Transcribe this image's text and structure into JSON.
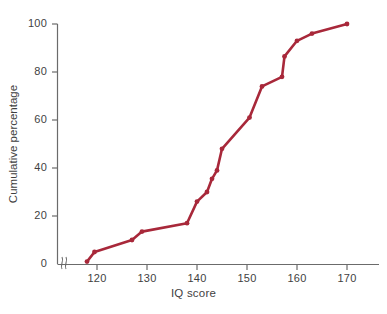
{
  "chart_data": {
    "type": "line",
    "title": "",
    "xlabel": "IQ score",
    "ylabel": "Cumulative percentage",
    "xlim": [
      113,
      178
    ],
    "ylim": [
      0,
      100
    ],
    "grid": false,
    "legend": "none",
    "axis_break": true,
    "line_color": "#a8283a",
    "marker": "circle",
    "x_ticks": [
      120,
      130,
      140,
      150,
      160,
      170
    ],
    "y_ticks": [
      0,
      20,
      40,
      60,
      80,
      100
    ],
    "x": [
      118,
      119.5,
      127,
      129,
      138,
      140,
      142,
      143,
      144,
      145,
      150.5,
      153,
      157,
      157.5,
      160,
      163,
      170
    ],
    "y": [
      1,
      5,
      10,
      13.5,
      17,
      26,
      30,
      35.5,
      39,
      48,
      61,
      74,
      78,
      86.5,
      93,
      96,
      100
    ],
    "points": [
      {
        "x": 118,
        "y": 1
      },
      {
        "x": 119.5,
        "y": 5
      },
      {
        "x": 127,
        "y": 10
      },
      {
        "x": 129,
        "y": 13.5
      },
      {
        "x": 138,
        "y": 17
      },
      {
        "x": 140,
        "y": 26
      },
      {
        "x": 142,
        "y": 30
      },
      {
        "x": 143,
        "y": 35.5
      },
      {
        "x": 144,
        "y": 39
      },
      {
        "x": 145,
        "y": 48
      },
      {
        "x": 150.5,
        "y": 61
      },
      {
        "x": 153,
        "y": 74
      },
      {
        "x": 157,
        "y": 78
      },
      {
        "x": 157.5,
        "y": 86.5
      },
      {
        "x": 160,
        "y": 93
      },
      {
        "x": 163,
        "y": 96
      },
      {
        "x": 170,
        "y": 100
      }
    ]
  },
  "axes": {
    "y_tick_labels": [
      "0",
      "20",
      "40",
      "60",
      "80",
      "100"
    ],
    "x_tick_labels": [
      "120",
      "130",
      "140",
      "150",
      "160",
      "170"
    ],
    "x_title": "IQ score",
    "y_title": "Cumulative percentage"
  },
  "caption": ""
}
